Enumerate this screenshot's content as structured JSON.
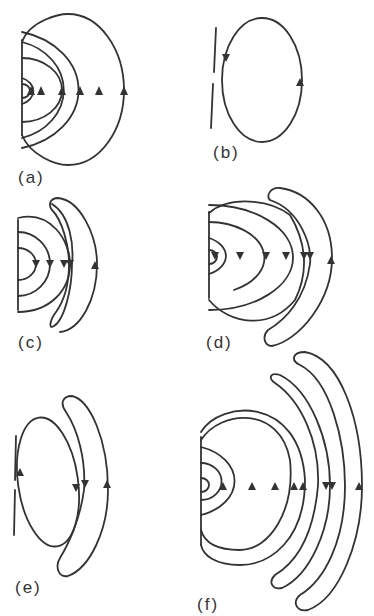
{
  "panels": [
    {
      "id": "a",
      "label": "(a)",
      "description": "nested half-loops closing on a wall, all arrows upward on right side"
    },
    {
      "id": "b",
      "label": "(b)",
      "description": "single closed loop beside a broken wall"
    },
    {
      "id": "c",
      "label": "(c)",
      "description": "nested half-loops plus one detached crescent loop"
    },
    {
      "id": "d",
      "label": "(d)",
      "description": "nested half-loops plus one detached crescent loop, larger"
    },
    {
      "id": "e",
      "label": "(e)",
      "description": "closed loop beside broken wall plus detached crescent loop"
    },
    {
      "id": "f",
      "label": "(f)",
      "description": "nested half-loops plus two detached crescent loops"
    }
  ],
  "colors": {
    "stroke": "#333333",
    "background": "#ffffff"
  }
}
